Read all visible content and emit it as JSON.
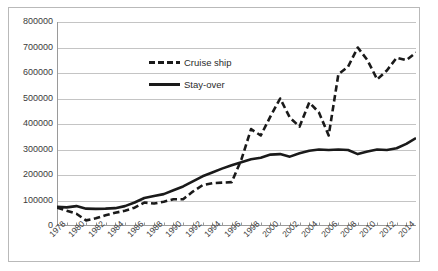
{
  "chart_data": {
    "type": "line",
    "title": "",
    "subtitle": "",
    "xlabel": "",
    "ylabel": "",
    "grid": true,
    "legend_position": "inside-upper-center",
    "xlim": [
      1978,
      2015
    ],
    "ylim": [
      0,
      800000
    ],
    "y_ticks": [
      0,
      100000,
      200000,
      300000,
      400000,
      500000,
      600000,
      700000,
      800000
    ],
    "y_tick_labels": [
      "0",
      "100000",
      "200000",
      "300000",
      "400000",
      "500000",
      "600000",
      "700000",
      "800000"
    ],
    "x": [
      1978,
      1979,
      1980,
      1981,
      1982,
      1983,
      1984,
      1985,
      1986,
      1987,
      1988,
      1989,
      1990,
      1991,
      1992,
      1993,
      1994,
      1995,
      1996,
      1997,
      1998,
      1999,
      2000,
      2001,
      2002,
      2003,
      2004,
      2005,
      2006,
      2007,
      2008,
      2009,
      2010,
      2011,
      2012,
      2013,
      2014,
      2015
    ],
    "x_tick_labels": [
      "1978",
      "1980",
      "1982",
      "1984",
      "1986",
      "1988",
      "1990",
      "1992",
      "1994",
      "1996",
      "1998",
      "2000",
      "2002",
      "2004",
      "2006",
      "2008",
      "2010",
      "2012",
      "2014"
    ],
    "x_tick_values": [
      1978,
      1980,
      1982,
      1984,
      1986,
      1988,
      1990,
      1992,
      1994,
      1996,
      1998,
      2000,
      2002,
      2004,
      2006,
      2008,
      2010,
      2012,
      2014
    ],
    "series": [
      {
        "name": "Cruise ship",
        "style": "dashed",
        "color": "#1a1a1a",
        "values": [
          72000,
          60000,
          48000,
          22000,
          30000,
          42000,
          52000,
          60000,
          72000,
          92000,
          88000,
          95000,
          105000,
          105000,
          135000,
          160000,
          168000,
          170000,
          172000,
          260000,
          380000,
          355000,
          430000,
          500000,
          425000,
          390000,
          485000,
          445000,
          355000,
          595000,
          625000,
          700000,
          650000,
          575000,
          610000,
          660000,
          650000,
          680000
        ]
      },
      {
        "name": "Stay-over",
        "style": "solid",
        "color": "#1a1a1a",
        "values": [
          75000,
          73000,
          78000,
          68000,
          67000,
          68000,
          70000,
          78000,
          92000,
          110000,
          118000,
          125000,
          140000,
          155000,
          175000,
          195000,
          210000,
          225000,
          238000,
          250000,
          262000,
          268000,
          280000,
          282000,
          272000,
          285000,
          295000,
          300000,
          298000,
          300000,
          298000,
          282000,
          292000,
          300000,
          298000,
          305000,
          322000,
          345000
        ]
      }
    ]
  },
  "legend": {
    "items": [
      {
        "label": "Cruise ship",
        "style": "dashed"
      },
      {
        "label": "Stay-over",
        "style": "solid"
      }
    ]
  }
}
